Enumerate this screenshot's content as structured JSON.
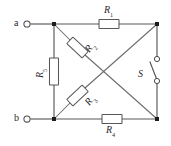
{
  "diagram": {
    "type": "electrical-schematic",
    "background_color": "#ffffff",
    "wire_color": "#58585a",
    "label_color": "#2b2b2b"
  },
  "terminals": [
    {
      "id": "a",
      "label": "a",
      "position": "top-left"
    },
    {
      "id": "b",
      "label": "b",
      "position": "bottom-left"
    }
  ],
  "resistors": [
    {
      "id": "R1",
      "letter": "R",
      "subscript": "1",
      "label": "R1",
      "orientation": "horizontal",
      "location": "top-branch"
    },
    {
      "id": "R2",
      "letter": "R",
      "subscript": "2",
      "label": "R2",
      "orientation": "diagonal",
      "location": "upper-left-diagonal"
    },
    {
      "id": "R3",
      "letter": "R",
      "subscript": "3",
      "label": "R3",
      "orientation": "diagonal",
      "location": "lower-left-diagonal"
    },
    {
      "id": "R4",
      "letter": "R",
      "subscript": "4",
      "label": "R4",
      "orientation": "horizontal",
      "location": "bottom-branch"
    },
    {
      "id": "R5",
      "letter": "R",
      "subscript": "5",
      "label": "R5",
      "orientation": "vertical",
      "location": "left-branch"
    }
  ],
  "switch": {
    "id": "S",
    "letter": "S",
    "label": "S",
    "state": "open",
    "location": "right-branch"
  },
  "nodes": [
    {
      "id": "top-left",
      "type": "junction"
    },
    {
      "id": "top-right",
      "type": "junction"
    },
    {
      "id": "bottom-left",
      "type": "junction"
    },
    {
      "id": "bottom-right",
      "type": "junction"
    },
    {
      "id": "center-crossing",
      "type": "no-connection"
    }
  ]
}
